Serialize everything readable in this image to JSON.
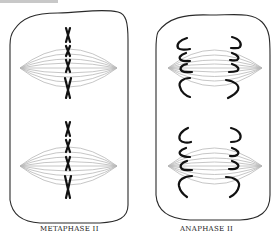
{
  "figure": {
    "panels": [
      {
        "id": "metaphase-ii",
        "caption": "METAPHASE II",
        "description": "Cell with two spindles; chromosomes aligned at metaphase plate in center of each spindle",
        "spindles": 2,
        "chromosomes_per_spindle": 4
      },
      {
        "id": "anaphase-ii",
        "caption": "ANAPHASE II",
        "description": "Cell with two spindles; sister chromatids separating toward opposite poles",
        "spindles": 2,
        "chromatid_pairs_per_spindle": 4
      }
    ],
    "colors": {
      "outline": "#2a2a2a",
      "spindle_fiber": "#b5b5b5",
      "chromosome": "#111111",
      "caption": "#222222"
    }
  }
}
